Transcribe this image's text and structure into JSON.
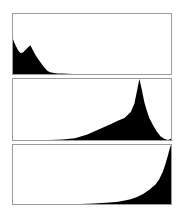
{
  "chart_data": [
    {
      "type": "area",
      "title": "",
      "description": "Luminance histogram - dark (underexposed) distribution",
      "xlabel": "",
      "ylabel": "",
      "xlim": [
        0,
        255
      ],
      "ylim": [
        0,
        100
      ],
      "grid": false,
      "fill_color": "#000000",
      "x": [
        0,
        4,
        8,
        12,
        16,
        20,
        24,
        28,
        32,
        36,
        40,
        44,
        48,
        52,
        56,
        60,
        64,
        72,
        80,
        88,
        96,
        255
      ],
      "values": [
        58,
        48,
        40,
        35,
        36,
        40,
        44,
        48,
        40,
        32,
        26,
        20,
        14,
        9,
        5,
        3,
        2,
        1,
        1,
        0.5,
        0,
        0
      ]
    },
    {
      "type": "area",
      "title": "",
      "description": "Luminance histogram - bright peaked distribution",
      "xlabel": "",
      "ylabel": "",
      "xlim": [
        0,
        255
      ],
      "ylim": [
        0,
        100
      ],
      "grid": false,
      "fill_color": "#000000",
      "x": [
        0,
        60,
        80,
        100,
        120,
        140,
        160,
        170,
        180,
        190,
        196,
        200,
        204,
        208,
        212,
        216,
        220,
        226,
        232,
        238,
        244,
        250,
        255
      ],
      "values": [
        0,
        0,
        1,
        3,
        9,
        18,
        27,
        32,
        36,
        46,
        60,
        80,
        100,
        82,
        62,
        48,
        36,
        24,
        14,
        6,
        2,
        0,
        2
      ]
    },
    {
      "type": "area",
      "title": "",
      "description": "Luminance histogram - highlight-clipped (overexposed) distribution",
      "xlabel": "",
      "ylabel": "",
      "xlim": [
        0,
        255
      ],
      "ylim": [
        0,
        100
      ],
      "grid": false,
      "fill_color": "#000000",
      "x": [
        0,
        110,
        130,
        150,
        170,
        190,
        200,
        210,
        220,
        230,
        236,
        242,
        246,
        250,
        253,
        255
      ],
      "values": [
        0,
        0,
        1,
        2,
        4,
        8,
        12,
        17,
        24,
        33,
        42,
        55,
        68,
        82,
        94,
        100
      ]
    }
  ]
}
